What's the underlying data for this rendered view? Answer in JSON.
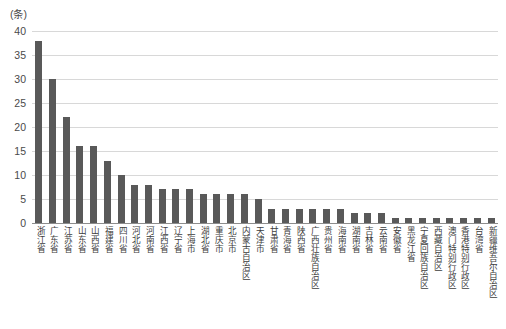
{
  "chart_data": {
    "type": "bar",
    "title": "",
    "subtitle": "",
    "unit_label": "(条)",
    "xlabel": "",
    "ylabel": "",
    "ylim": [
      0,
      40
    ],
    "ytick_step": 5,
    "yticks": [
      40,
      35,
      30,
      25,
      20,
      15,
      10,
      5,
      0
    ],
    "grid": true,
    "legend": "none",
    "bar_color": "#595959",
    "gridline_color": "#d8d8d8",
    "axis_color": "#8d8d8d",
    "categories": [
      "浙江省",
      "广东省",
      "江苏省",
      "山东省",
      "山西省",
      "福建省",
      "四川省",
      "河北省",
      "河南省",
      "江西省",
      "辽宁省",
      "上海市",
      "湖北省",
      "重庆市",
      "北京市",
      "内蒙古自治区",
      "天津市",
      "甘肃省",
      "青海省",
      "陕西省",
      "广西壮族自治区",
      "贵州省",
      "海南省",
      "湖南省",
      "吉林省",
      "云南省",
      "安徽省",
      "黑龙江省",
      "宁夏回族自治区",
      "西藏自治区",
      "澳门特别行政区",
      "香港特别行政区",
      "台湾省",
      "新疆维吾尔自治区"
    ],
    "values": [
      38,
      30,
      22,
      16,
      16,
      13,
      10,
      8,
      8,
      7,
      7,
      7,
      6,
      6,
      6,
      6,
      5,
      3,
      3,
      3,
      3,
      3,
      3,
      2,
      2,
      2,
      1,
      1,
      1,
      1,
      1,
      1,
      1,
      1
    ]
  }
}
